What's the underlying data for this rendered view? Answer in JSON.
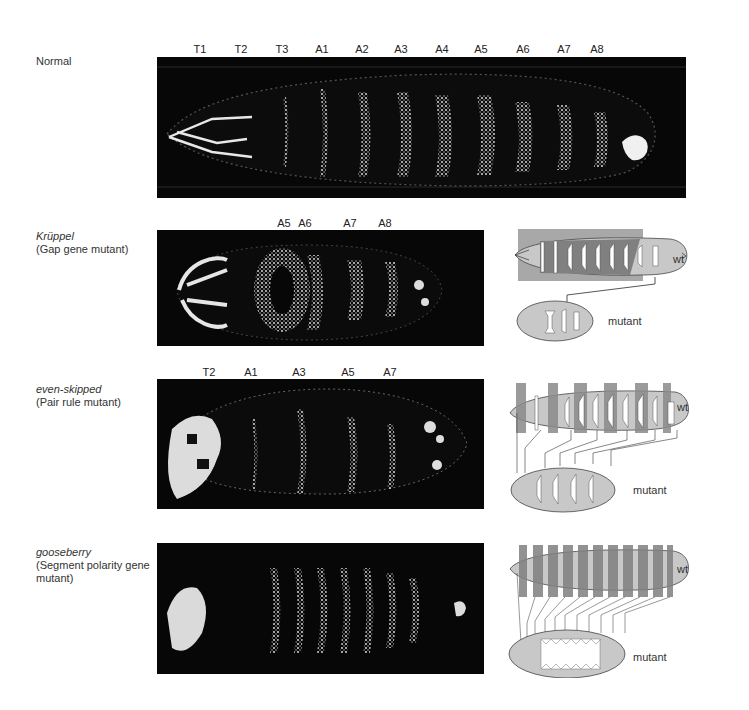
{
  "panels": [
    {
      "id": "normal",
      "title": "Normal",
      "subtitle": "",
      "segment_labels": [
        "T1",
        "T2",
        "T3",
        "A1",
        "A2",
        "A3",
        "A4",
        "A5",
        "A6",
        "A7",
        "A8"
      ]
    },
    {
      "id": "kruppel",
      "title": "Krüppel",
      "subtitle": "(Gap gene mutant)",
      "segment_labels": [
        "A5",
        "A6",
        "A7",
        "A8"
      ],
      "diagram": {
        "wt_label": "wt",
        "mutant_label": "mutant"
      }
    },
    {
      "id": "even-skipped",
      "title": "even-skipped",
      "subtitle": "(Pair rule mutant)",
      "segment_labels": [
        "T2",
        "A1",
        "A3",
        "A5",
        "A7"
      ],
      "diagram": {
        "wt_label": "wt",
        "mutant_label": "mutant"
      }
    },
    {
      "id": "gooseberry",
      "title": "gooseberry",
      "subtitle": "(Segment polarity gene mutant)",
      "segment_labels": [],
      "diagram": {
        "wt_label": "wt",
        "mutant_label": "mutant"
      }
    }
  ],
  "colors": {
    "photo_bg": "#070707",
    "denticle": "#f2f2f2",
    "diagram_light": "#c9c9c9",
    "diagram_dark": "#7d7d7d",
    "diagram_mid": "#a5a5a5"
  }
}
